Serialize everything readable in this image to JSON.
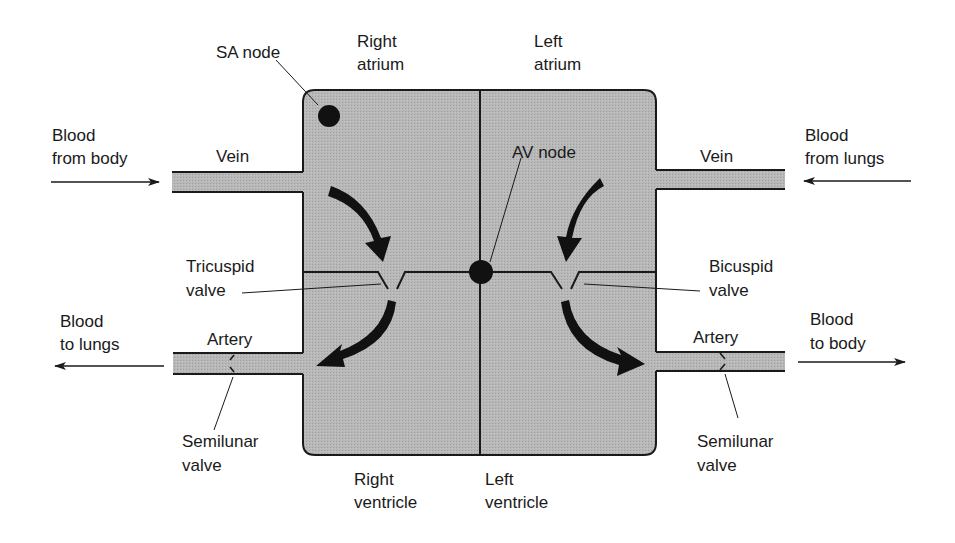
{
  "diagram": {
    "colors": {
      "chamber_fill": "#b3b3b3",
      "outline": "#1a1a1a",
      "background": "#ffffff"
    },
    "labels": {
      "sa_node": "SA node",
      "right_atrium_1": "Right",
      "right_atrium_2": "atrium",
      "left_atrium_1": "Left",
      "left_atrium_2": "atrium",
      "blood_from_body_1": "Blood",
      "blood_from_body_2": "from body",
      "vein_left": "Vein",
      "av_node": "AV node",
      "vein_right": "Vein",
      "blood_from_lungs_1": "Blood",
      "blood_from_lungs_2": "from lungs",
      "tricuspid_1": "Tricuspid",
      "tricuspid_2": "valve",
      "bicuspid_1": "Bicuspid",
      "bicuspid_2": "valve",
      "blood_to_lungs_1": "Blood",
      "blood_to_lungs_2": "to lungs",
      "artery_left": "Artery",
      "artery_right": "Artery",
      "blood_to_body_1": "Blood",
      "blood_to_body_2": "to body",
      "semilunar_left_1": "Semilunar",
      "semilunar_left_2": "valve",
      "semilunar_right_1": "Semilunar",
      "semilunar_right_2": "valve",
      "right_ventricle_1": "Right",
      "right_ventricle_2": "ventricle",
      "left_ventricle_1": "Left",
      "left_ventricle_2": "ventricle"
    },
    "nodes": [
      {
        "name": "SA node",
        "location": "right atrium, upper-left corner"
      },
      {
        "name": "AV node",
        "location": "junction of septum and atrioventricular boundary"
      }
    ],
    "flows": [
      {
        "from": "body",
        "via": "vein",
        "to": "right atrium"
      },
      {
        "from": "right atrium",
        "via": "tricuspid valve",
        "to": "right ventricle"
      },
      {
        "from": "right ventricle",
        "via": "artery / semilunar valve",
        "to": "lungs"
      },
      {
        "from": "lungs",
        "via": "vein",
        "to": "left atrium"
      },
      {
        "from": "left atrium",
        "via": "bicuspid valve",
        "to": "left ventricle"
      },
      {
        "from": "left ventricle",
        "via": "artery / semilunar valve",
        "to": "body"
      }
    ]
  }
}
